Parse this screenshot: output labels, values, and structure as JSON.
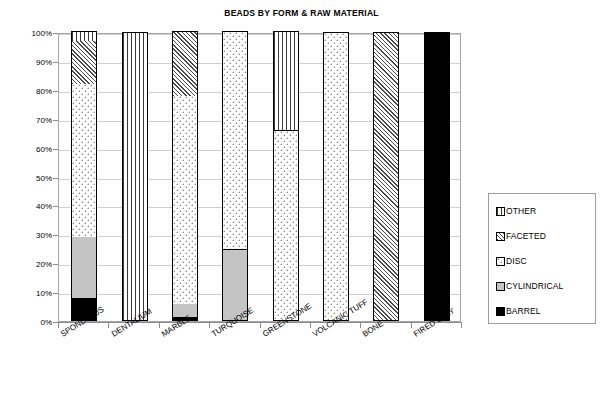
{
  "chart_data": {
    "type": "bar",
    "subtype": "stacked-100-percent",
    "title": "BEADS BY FORM & RAW MATERIAL",
    "xlabel": "",
    "ylabel": "",
    "ylim": [
      0,
      100
    ],
    "ytick_labels": [
      "100%",
      "90%",
      "80%",
      "70%",
      "60%",
      "50%",
      "40%",
      "30%",
      "20%",
      "10%",
      "0%"
    ],
    "ytick_values": [
      100,
      90,
      80,
      70,
      60,
      50,
      40,
      30,
      20,
      10,
      0
    ],
    "grid": true,
    "legend_position": "right",
    "categories": [
      "SPONDYLUS",
      "DENTALIUM",
      "MARBLE",
      "TURQUOISE",
      "GREENSTONE",
      "VOLCANIC TUFF",
      "BONE",
      "FIRED CLAY"
    ],
    "series": [
      {
        "name": "BARREL",
        "pattern": "solid-black",
        "values": [
          8,
          0,
          1.5,
          0,
          0,
          0,
          0,
          100
        ]
      },
      {
        "name": "CYLINDRICAL",
        "pattern": "solid-gray",
        "values": [
          21,
          0,
          4.5,
          25,
          0,
          0,
          0,
          0
        ]
      },
      {
        "name": "DISC",
        "pattern": "fine-dots",
        "values": [
          53,
          0,
          72,
          75,
          66,
          100,
          0,
          0
        ]
      },
      {
        "name": "FACETED",
        "pattern": "diagonal-hatch",
        "values": [
          15,
          0,
          22,
          0,
          0,
          0,
          100,
          0
        ]
      },
      {
        "name": "OTHER",
        "pattern": "vertical-lines",
        "values": [
          3,
          100,
          0,
          0,
          34,
          0,
          0,
          0
        ]
      }
    ],
    "stack_order_bottom_to_top": [
      "BARREL",
      "CYLINDRICAL",
      "DISC",
      "FACETED",
      "OTHER"
    ]
  },
  "legend": {
    "items": [
      {
        "label": "OTHER",
        "swatch": "vertical-lines-swatch"
      },
      {
        "label": "FACETED",
        "swatch": "diagonal-hatch-swatch"
      },
      {
        "label": "DISC",
        "swatch": "fine-dots-swatch"
      },
      {
        "label": "CYLINDRICAL",
        "swatch": "solid-gray-swatch"
      },
      {
        "label": "BARREL",
        "swatch": "solid-black-swatch"
      }
    ]
  },
  "colors": {
    "plot_border": "#a6a6a6",
    "gridline": "#d0d0d0",
    "axis": "#8c8c8c",
    "barrel": "#000000",
    "cylindrical": "#c4c4c4",
    "text": "#000000",
    "background": "#ffffff"
  }
}
